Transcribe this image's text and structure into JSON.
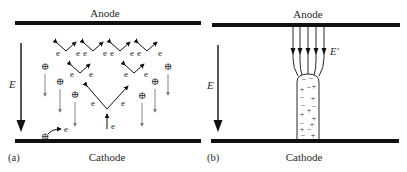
{
  "figure": {
    "panel_a": {
      "tag": "(a)",
      "anode_label": "Anode",
      "cathode_label": "Cathode",
      "field_label": "E",
      "electron_symbol": "e",
      "ion_symbol": "⊕",
      "description": "Electron avalanche: electrons multiply toward anode, positive ions drift toward cathode, secondary electron emission at cathode"
    },
    "panel_b": {
      "tag": "(b)",
      "anode_label": "Anode",
      "cathode_label": "Cathode",
      "field_label": "E",
      "enhanced_field_label": "E′",
      "streamer_charges": [
        [
          "−",
          "−"
        ],
        [
          "+",
          "−",
          "+"
        ],
        [
          "−",
          "+"
        ],
        [
          "−",
          "+"
        ],
        [
          "+",
          "−",
          "+"
        ],
        [
          "−",
          "+"
        ],
        [
          "+",
          "−"
        ],
        [
          "−",
          "+"
        ]
      ],
      "description": "Streamer channel bridging the gap with enhanced field E′ lines converging at its head"
    },
    "colors": {
      "electrode": "#111111",
      "arrow_dark": "#111111",
      "arrow_grey": "#777777",
      "text": "#2a2a2a"
    }
  }
}
